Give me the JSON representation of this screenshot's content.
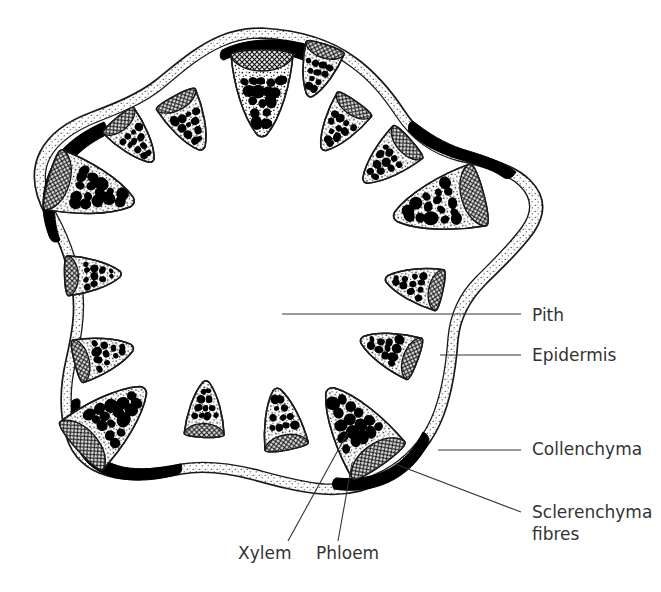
{
  "diagram": {
    "shape": "five-lobed star outline",
    "background_color": "#ffffff",
    "ink_color": "#1a1a1a",
    "label_color": "#333333",
    "phloem_fill_color": "#9a9a9a",
    "sclerenchyma_color": "#000000"
  },
  "labels": [
    {
      "id": "pith",
      "text": "Pith",
      "text2": "",
      "x": 532,
      "y": 321,
      "leader": {
        "x1": 282,
        "y1": 314,
        "x2": 521,
        "y2": 314
      }
    },
    {
      "id": "epidermis",
      "text": "Epidermis",
      "text2": "",
      "x": 532,
      "y": 361,
      "leader": {
        "x1": 440,
        "y1": 355,
        "x2": 521,
        "y2": 355
      }
    },
    {
      "id": "collenchyma",
      "text": "Collenchyma",
      "text2": "",
      "x": 532,
      "y": 455,
      "leader": {
        "x1": 438,
        "y1": 450,
        "x2": 521,
        "y2": 450
      }
    },
    {
      "id": "sclerenchyma",
      "text": "Sclerenchyma",
      "text2": "fibres",
      "x": 532,
      "y": 518,
      "leader": {
        "x1": 395,
        "y1": 464,
        "x2": 521,
        "y2": 512
      }
    },
    {
      "id": "xylem",
      "text": "Xylem",
      "text2": "",
      "x": 238,
      "y": 559,
      "leader": {
        "x1": 348,
        "y1": 432,
        "x2": 288,
        "y2": 541
      }
    },
    {
      "id": "phloem",
      "text": "Phloem",
      "text2": "",
      "x": 316,
      "y": 559,
      "leader": {
        "x1": 352,
        "y1": 463,
        "x2": 338,
        "y2": 541
      }
    }
  ],
  "structures": {
    "pith_label": "Pith",
    "epidermis_label": "Epidermis",
    "collenchyma_label": "Collenchyma",
    "sclerenchyma_label": "Sclerenchyma fibres",
    "xylem_label": "Xylem",
    "phloem_label": "Phloem"
  },
  "vascular_bundles": [
    {
      "cx": 262,
      "cy": 92,
      "w": 62,
      "h": 86,
      "rot": 0,
      "size": "large"
    },
    {
      "cx": 188,
      "cy": 122,
      "w": 44,
      "h": 60,
      "rot": -28,
      "size": "small"
    },
    {
      "cx": 134,
      "cy": 139,
      "w": 40,
      "h": 56,
      "rot": -40,
      "size": "small"
    },
    {
      "cx": 90,
      "cy": 190,
      "w": 62,
      "h": 88,
      "rot": -74,
      "size": "large"
    },
    {
      "cx": 92,
      "cy": 275,
      "w": 40,
      "h": 56,
      "rot": -92,
      "size": "small"
    },
    {
      "cx": 103,
      "cy": 355,
      "w": 44,
      "h": 60,
      "rot": -104,
      "size": "small"
    },
    {
      "cx": 110,
      "cy": 420,
      "w": 64,
      "h": 90,
      "rot": -132,
      "size": "large"
    },
    {
      "cx": 205,
      "cy": 410,
      "w": 40,
      "h": 56,
      "rot": -178,
      "size": "small"
    },
    {
      "cx": 282,
      "cy": 420,
      "w": 44,
      "h": 62,
      "rot": -190,
      "size": "small"
    },
    {
      "cx": 356,
      "cy": 428,
      "w": 64,
      "h": 92,
      "rot": -215,
      "size": "large"
    },
    {
      "cx": 390,
      "cy": 350,
      "w": 44,
      "h": 60,
      "rot": -250,
      "size": "small"
    },
    {
      "cx": 415,
      "cy": 285,
      "w": 42,
      "h": 58,
      "rot": -258,
      "size": "small"
    },
    {
      "cx": 440,
      "cy": 205,
      "w": 64,
      "h": 92,
      "rot": -285,
      "size": "large"
    },
    {
      "cx": 388,
      "cy": 160,
      "w": 44,
      "h": 62,
      "rot": -312,
      "size": "small"
    },
    {
      "cx": 340,
      "cy": 125,
      "w": 42,
      "h": 58,
      "rot": -325,
      "size": "small"
    },
    {
      "cx": 318,
      "cy": 70,
      "w": 40,
      "h": 54,
      "rot": -342,
      "size": "small"
    }
  ],
  "sclerenchyma_caps": [
    {
      "id": "cap-top",
      "rot": 0
    },
    {
      "id": "cap-upper-left",
      "rot": -72
    },
    {
      "id": "cap-lower-left",
      "rot": -144
    },
    {
      "id": "cap-lower-right",
      "rot": -216
    },
    {
      "id": "cap-upper-right",
      "rot": -288
    }
  ]
}
